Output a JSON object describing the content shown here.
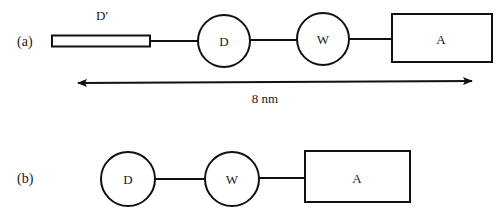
{
  "panel_a": {
    "label": "(a)",
    "dprime_label": "D′",
    "donor_label": "D",
    "spacer_label": "W",
    "acceptor_label": "A",
    "distance_label": "8 nm"
  },
  "panel_b": {
    "label": "(b)",
    "donor_label": "D",
    "spacer_label": "W",
    "acceptor_label": "A"
  },
  "colors": {
    "stroke": "#111111",
    "background": "#ffffff"
  }
}
